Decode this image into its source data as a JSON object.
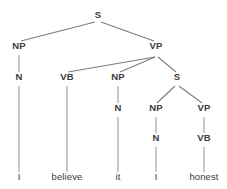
{
  "figure": {
    "kind": "syntax-tree",
    "sentence": "I believe it honest",
    "colors": {
      "background": "#ffffff",
      "label_text": "#3b3b3b",
      "vertical_edge": "#9d9d9d",
      "diagonal_edge": "#7c7c7c"
    }
  },
  "nodes": [
    {
      "id": "s-root",
      "label": "S",
      "x": 98,
      "y": 18,
      "type": "nonterminal"
    },
    {
      "id": "np-subject",
      "label": "NP",
      "x": 19,
      "y": 49,
      "type": "nonterminal"
    },
    {
      "id": "vp-main",
      "label": "VP",
      "x": 156,
      "y": 49,
      "type": "nonterminal"
    },
    {
      "id": "n-subject",
      "label": "N",
      "x": 19,
      "y": 80,
      "type": "nonterminal"
    },
    {
      "id": "vb-believe",
      "label": "VB",
      "x": 67,
      "y": 80,
      "type": "nonterminal"
    },
    {
      "id": "np-object",
      "label": "NP",
      "x": 118,
      "y": 80,
      "type": "nonterminal"
    },
    {
      "id": "s-embedded",
      "label": "S",
      "x": 177,
      "y": 80,
      "type": "nonterminal"
    },
    {
      "id": "n-object",
      "label": "N",
      "x": 118,
      "y": 111,
      "type": "nonterminal"
    },
    {
      "id": "np-small",
      "label": "NP",
      "x": 156,
      "y": 111,
      "type": "nonterminal"
    },
    {
      "id": "vp-small",
      "label": "VP",
      "x": 204,
      "y": 111,
      "type": "nonterminal"
    },
    {
      "id": "n-small",
      "label": "N",
      "x": 156,
      "y": 141,
      "type": "nonterminal"
    },
    {
      "id": "vb-honest",
      "label": "VB",
      "x": 204,
      "y": 141,
      "type": "nonterminal"
    },
    {
      "id": "leaf-i-1",
      "label": "I",
      "x": 19,
      "y": 180,
      "type": "terminal"
    },
    {
      "id": "leaf-believe",
      "label": "believe",
      "x": 67,
      "y": 180,
      "type": "terminal"
    },
    {
      "id": "leaf-it",
      "label": "it",
      "x": 118,
      "y": 180,
      "type": "terminal"
    },
    {
      "id": "leaf-i-2",
      "label": "I",
      "x": 156,
      "y": 180,
      "type": "terminal"
    },
    {
      "id": "leaf-honest",
      "label": "honest",
      "x": 204,
      "y": 180,
      "type": "terminal"
    }
  ],
  "edges": [
    {
      "id": "e-s-np",
      "from": "s-root",
      "to": "np-subject",
      "style": "diagonal",
      "x1": 95,
      "y1": 22,
      "x2": 21,
      "y2": 41
    },
    {
      "id": "e-s-vp",
      "from": "s-root",
      "to": "vp-main",
      "style": "diagonal",
      "x1": 101,
      "y1": 22,
      "x2": 154,
      "y2": 41
    },
    {
      "id": "e-np-n",
      "from": "np-subject",
      "to": "n-subject",
      "style": "vertical",
      "x1": 19,
      "y1": 55,
      "x2": 19,
      "y2": 72
    },
    {
      "id": "e-vp-vb",
      "from": "vp-main",
      "to": "vb-believe",
      "style": "diagonal",
      "x1": 155,
      "y1": 57,
      "x2": 68,
      "y2": 72
    },
    {
      "id": "e-vp-np",
      "from": "vp-main",
      "to": "np-object",
      "style": "diagonal",
      "x1": 155,
      "y1": 57,
      "x2": 120,
      "y2": 72
    },
    {
      "id": "e-vp-s",
      "from": "vp-main",
      "to": "s-embedded",
      "style": "diagonal",
      "x1": 158,
      "y1": 57,
      "x2": 176,
      "y2": 72
    },
    {
      "id": "e-n-leaf-i1",
      "from": "n-subject",
      "to": "leaf-i-1",
      "style": "vertical",
      "x1": 19,
      "y1": 86,
      "x2": 19,
      "y2": 172
    },
    {
      "id": "e-vb-believe",
      "from": "vb-believe",
      "to": "leaf-believe",
      "style": "vertical",
      "x1": 67,
      "y1": 86,
      "x2": 67,
      "y2": 172
    },
    {
      "id": "e-npobj-n",
      "from": "np-object",
      "to": "n-object",
      "style": "vertical",
      "x1": 118,
      "y1": 86,
      "x2": 118,
      "y2": 103
    },
    {
      "id": "e-sem-np",
      "from": "s-embedded",
      "to": "np-small",
      "style": "diagonal",
      "x1": 175,
      "y1": 86,
      "x2": 157,
      "y2": 103
    },
    {
      "id": "e-sem-vp",
      "from": "s-embedded",
      "to": "vp-small",
      "style": "diagonal",
      "x1": 179,
      "y1": 86,
      "x2": 202,
      "y2": 103
    },
    {
      "id": "e-nobj-it",
      "from": "n-object",
      "to": "leaf-it",
      "style": "vertical",
      "x1": 118,
      "y1": 117,
      "x2": 118,
      "y2": 172
    },
    {
      "id": "e-npsml-n",
      "from": "np-small",
      "to": "n-small",
      "style": "vertical",
      "x1": 156,
      "y1": 117,
      "x2": 156,
      "y2": 133
    },
    {
      "id": "e-vpsml-vb",
      "from": "vp-small",
      "to": "vb-honest",
      "style": "vertical",
      "x1": 204,
      "y1": 117,
      "x2": 204,
      "y2": 133
    },
    {
      "id": "e-nsml-leaf-i2",
      "from": "n-small",
      "to": "leaf-i-2",
      "style": "vertical",
      "x1": 156,
      "y1": 147,
      "x2": 156,
      "y2": 172
    },
    {
      "id": "e-vbhon-honest",
      "from": "vb-honest",
      "to": "leaf-honest",
      "style": "vertical",
      "x1": 204,
      "y1": 147,
      "x2": 204,
      "y2": 172
    }
  ]
}
